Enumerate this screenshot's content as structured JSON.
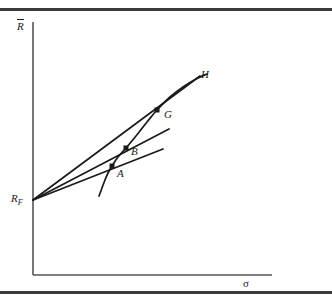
{
  "figure": {
    "kind": "finance-diagram",
    "background_color": "#ffffff",
    "ink_color": "#1a1a1a",
    "rule_color": "#3a3a3a"
  },
  "axes": {
    "y_label": "R",
    "y_label_has_overbar": true,
    "x_label": "σ",
    "origin_label": "R",
    "origin_label_subscript": "F"
  },
  "points": [
    {
      "id": "A",
      "label": "A"
    },
    {
      "id": "B",
      "label": "B"
    },
    {
      "id": "G",
      "label": "G"
    },
    {
      "id": "H",
      "label": "H"
    }
  ],
  "chart_data": {
    "type": "line",
    "title": "",
    "xlabel": "σ",
    "ylabel": "R̄",
    "xlim": [
      0,
      332
    ],
    "ylim": [
      0,
      305
    ],
    "grid": false,
    "legend": "none",
    "axis_geometry": {
      "y_axis_x": 33,
      "y_axis_top_y": 22,
      "x_axis_y": 275,
      "x_axis_right_x": 272
    },
    "risk_free_point": {
      "x": 33,
      "y": 200,
      "label": "R_F"
    },
    "markers": [
      {
        "label": "A",
        "x": 112,
        "y": 166,
        "marker": "square",
        "size": 5
      },
      {
        "label": "B",
        "x": 126,
        "y": 148,
        "marker": "square",
        "size": 5
      },
      {
        "label": "G",
        "x": 157,
        "y": 110,
        "marker": "square",
        "size": 5
      }
    ],
    "series": [
      {
        "name": "efficient-frontier-curve",
        "kind": "curve",
        "points": [
          [
            99,
            196
          ],
          [
            102,
            188
          ],
          [
            105,
            180
          ],
          [
            108,
            173
          ],
          [
            112,
            166
          ],
          [
            118,
            157
          ],
          [
            126,
            148
          ],
          [
            136,
            136
          ],
          [
            147,
            122
          ],
          [
            157,
            110
          ],
          [
            170,
            97
          ],
          [
            183,
            87
          ],
          [
            196,
            79
          ],
          [
            207,
            74
          ]
        ]
      },
      {
        "name": "capital-market-line-tangent-H",
        "kind": "straight",
        "points": [
          [
            33,
            200
          ],
          [
            200,
            76
          ]
        ],
        "endpoint_label": "H"
      },
      {
        "name": "line-through-B",
        "kind": "straight",
        "points": [
          [
            33,
            200
          ],
          [
            169,
            129
          ]
        ]
      },
      {
        "name": "line-through-A",
        "kind": "straight",
        "points": [
          [
            33,
            200
          ],
          [
            163,
            149
          ]
        ]
      }
    ]
  }
}
